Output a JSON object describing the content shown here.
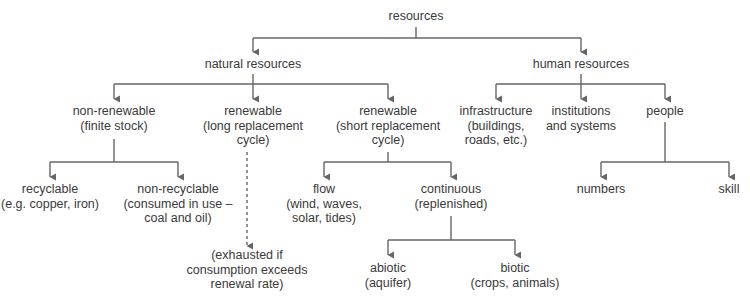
{
  "diagram": {
    "title": "resources",
    "colors": {
      "text": "#3a3a3a",
      "line": "#666666",
      "background": "#ffffff"
    },
    "nodes": {
      "resources": {
        "lines": [
          "resources"
        ]
      },
      "natural": {
        "lines": [
          "natural resources"
        ]
      },
      "human": {
        "lines": [
          "human resources"
        ]
      },
      "non_renewable": {
        "lines": [
          "non-renewable",
          "(finite stock)"
        ]
      },
      "renewable_long": {
        "lines": [
          "renewable",
          "(long replacement",
          "cycle)"
        ]
      },
      "renewable_short": {
        "lines": [
          "renewable",
          "(short replacement",
          "cycle)"
        ]
      },
      "infrastructure": {
        "lines": [
          "infrastructure",
          "(buildings,",
          "roads, etc.)"
        ]
      },
      "institutions": {
        "lines": [
          "institutions",
          "and systems"
        ]
      },
      "people": {
        "lines": [
          "people"
        ]
      },
      "recyclable": {
        "lines": [
          "recyclable",
          "(e.g. copper, iron)"
        ]
      },
      "non_recyclable": {
        "lines": [
          "non-recyclable",
          "(consumed in use –",
          "coal and oil)"
        ]
      },
      "exhausted": {
        "lines": [
          "(exhausted if",
          "consumption exceeds",
          "renewal rate)"
        ]
      },
      "flow": {
        "lines": [
          "flow",
          "(wind, waves,",
          "solar, tides)"
        ]
      },
      "continuous": {
        "lines": [
          "continuous",
          "(replenished)"
        ]
      },
      "numbers": {
        "lines": [
          "numbers"
        ]
      },
      "skill": {
        "lines": [
          "skill"
        ]
      },
      "abiotic": {
        "lines": [
          "abiotic",
          "(aquifer)"
        ]
      },
      "biotic": {
        "lines": [
          "biotic",
          "(crops, animals)"
        ]
      }
    },
    "edges": [
      {
        "from": "resources",
        "to": "natural",
        "style": "solid"
      },
      {
        "from": "resources",
        "to": "human",
        "style": "solid"
      },
      {
        "from": "natural",
        "to": "non_renewable",
        "style": "solid"
      },
      {
        "from": "natural",
        "to": "renewable_long",
        "style": "solid"
      },
      {
        "from": "natural",
        "to": "renewable_short",
        "style": "solid"
      },
      {
        "from": "human",
        "to": "infrastructure",
        "style": "solid"
      },
      {
        "from": "human",
        "to": "institutions",
        "style": "solid"
      },
      {
        "from": "human",
        "to": "people",
        "style": "solid"
      },
      {
        "from": "non_renewable",
        "to": "recyclable",
        "style": "solid"
      },
      {
        "from": "non_renewable",
        "to": "non_recyclable",
        "style": "solid"
      },
      {
        "from": "renewable_long",
        "to": "exhausted",
        "style": "dashed"
      },
      {
        "from": "renewable_short",
        "to": "flow",
        "style": "solid"
      },
      {
        "from": "renewable_short",
        "to": "continuous",
        "style": "solid"
      },
      {
        "from": "people",
        "to": "numbers",
        "style": "solid"
      },
      {
        "from": "people",
        "to": "skill",
        "style": "solid"
      },
      {
        "from": "continuous",
        "to": "abiotic",
        "style": "solid"
      },
      {
        "from": "continuous",
        "to": "biotic",
        "style": "solid"
      }
    ]
  }
}
